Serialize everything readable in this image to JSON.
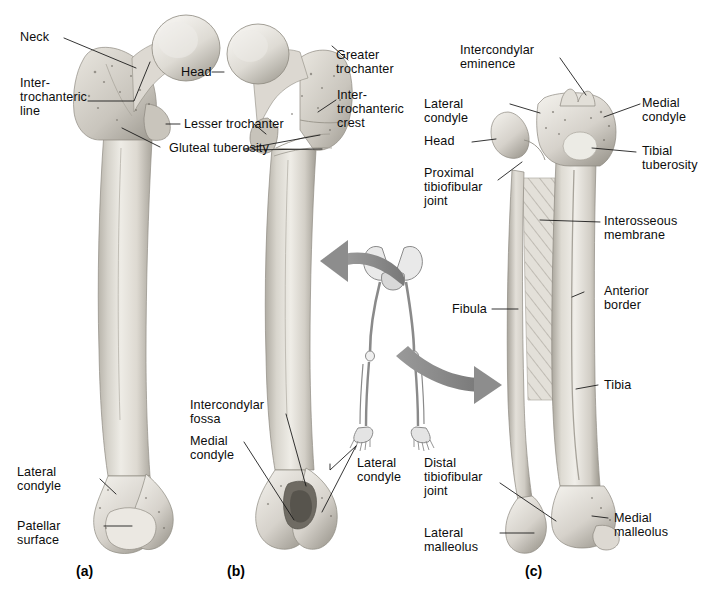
{
  "figure": {
    "background_color": "#ffffff",
    "bone_color": "#d9d6cf",
    "arrow_color": "#8c8c8c",
    "label_color": "#0d0d0d"
  },
  "panels": [
    {
      "id": "a",
      "letter": "(a)",
      "caption": "Anterior view of the femur"
    },
    {
      "id": "b",
      "letter": "(b)",
      "caption": "Posterior view of the femur"
    },
    {
      "id": "c",
      "letter": "(c)",
      "caption": "Anterior view of the tibia and fibula"
    }
  ],
  "labels": {
    "a": [
      {
        "key": "neck",
        "text": "Neck"
      },
      {
        "key": "intertrochanteric-line",
        "text": "Inter-\ntrochanteric\nline"
      },
      {
        "key": "head",
        "text": "Head"
      },
      {
        "key": "lesser-trochanter",
        "text": "Lesser trochanter"
      },
      {
        "key": "gluteal-tuberosity",
        "text": "Gluteal tuberosity"
      },
      {
        "key": "lateral-condyle",
        "text": "Lateral\ncondyle"
      },
      {
        "key": "patellar-surface",
        "text": "Patellar\nsurface"
      }
    ],
    "b": [
      {
        "key": "greater-trochanter",
        "text": "Greater\ntrochanter"
      },
      {
        "key": "intertrochanteric-crest",
        "text": "Inter-\ntrochanteric\ncrest"
      },
      {
        "key": "intercondylar-fossa",
        "text": "Intercondylar\nfossa"
      },
      {
        "key": "medial-condyle",
        "text": "Medial\ncondyle"
      },
      {
        "key": "lateral-condyle",
        "text": "Lateral\ncondyle"
      }
    ],
    "c": [
      {
        "key": "intercondylar-eminence",
        "text": "Intercondylar\neminence"
      },
      {
        "key": "lateral-condyle",
        "text": "Lateral\ncondyle"
      },
      {
        "key": "head",
        "text": "Head"
      },
      {
        "key": "proximal-tibiofibular-joint",
        "text": "Proximal\ntibiofibular\njoint"
      },
      {
        "key": "medial-condyle",
        "text": "Medial\ncondyle"
      },
      {
        "key": "tibial-tuberosity",
        "text": "Tibial\ntuberosity"
      },
      {
        "key": "interosseous-membrane",
        "text": "Interosseous\nmembrane"
      },
      {
        "key": "anterior-border",
        "text": "Anterior\nborder"
      },
      {
        "key": "fibula",
        "text": "Fibula"
      },
      {
        "key": "tibia",
        "text": "Tibia"
      },
      {
        "key": "distal-tibiofibular-joint",
        "text": "Distal\ntibiofibular\njoint"
      },
      {
        "key": "lateral-malleolus",
        "text": "Lateral\nmalleolus"
      },
      {
        "key": "medial-malleolus",
        "text": "Medial\nmalleolus"
      }
    ]
  },
  "orientation_figure": {
    "name": "lower-limb-skeleton-orientation",
    "description": "Small grey skeleton of pelvis and both legs with two curved arrows"
  },
  "arrows": [
    {
      "key": "arrow-to-femur",
      "direction": "left"
    },
    {
      "key": "arrow-to-tibia",
      "direction": "right"
    }
  ]
}
